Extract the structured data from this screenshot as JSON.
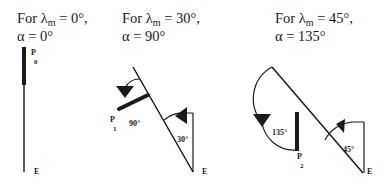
{
  "panels": [
    {
      "title_prefix": "For λ",
      "title_sub": "m",
      "title_rest": " = 0°,",
      "title_line2": "α = 0°",
      "point_label": "P",
      "point_sub": "0",
      "end_label": "E",
      "angles": []
    },
    {
      "title_prefix": "For λ",
      "title_sub": "m",
      "title_rest": " = 30°,",
      "title_line2": "α = 90°",
      "point_label": "P",
      "point_sub": "1",
      "end_label": "E",
      "angles": [
        "90°",
        "30°"
      ]
    },
    {
      "title_prefix": "For  λ",
      "title_sub": "m",
      "title_rest": " = 45°,",
      "title_line2": "α = 135°",
      "point_label": "P",
      "point_sub": "2",
      "end_label": "E",
      "angles": [
        "135°",
        "45°"
      ]
    }
  ],
  "colors": {
    "ink": "#1a1a1a",
    "background": "#ffffff"
  }
}
